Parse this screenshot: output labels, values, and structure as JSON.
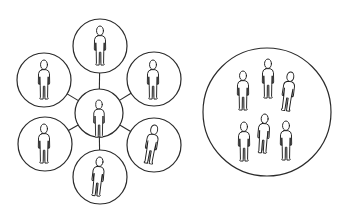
{
  "figure": {
    "title": "Network of individuals vs. group",
    "colors": {
      "stroke": "#2b2b2b",
      "fill": "#ffffff",
      "background": "#ffffff"
    }
  },
  "network": {
    "label": "Hub-and-spoke network",
    "hub": {
      "id": "hub",
      "cx": 99,
      "cy": 113,
      "r": 24,
      "people": [
        {
          "x": 99,
          "y": 100,
          "scale": 1.0,
          "tilt": 0
        }
      ]
    },
    "nodes": [
      {
        "id": "top",
        "cx": 100,
        "cy": 46,
        "r": 27,
        "people": [
          {
            "x": 100,
            "y": 26,
            "scale": 1.05,
            "tilt": 0
          }
        ]
      },
      {
        "id": "upper-right",
        "cx": 154,
        "cy": 79,
        "r": 27,
        "people": [
          {
            "x": 153,
            "y": 60,
            "scale": 1.05,
            "tilt": 0
          }
        ]
      },
      {
        "id": "lower-right",
        "cx": 154,
        "cy": 145,
        "r": 27,
        "people": [
          {
            "x": 155,
            "y": 125,
            "scale": 1.05,
            "tilt": 10
          }
        ]
      },
      {
        "id": "bottom",
        "cx": 100,
        "cy": 177,
        "r": 27,
        "people": [
          {
            "x": 100,
            "y": 157,
            "scale": 1.05,
            "tilt": 6
          }
        ]
      },
      {
        "id": "lower-left",
        "cx": 45,
        "cy": 144,
        "r": 27,
        "people": [
          {
            "x": 44,
            "y": 124,
            "scale": 1.05,
            "tilt": 0
          }
        ]
      },
      {
        "id": "upper-left",
        "cx": 44,
        "cy": 80,
        "r": 27,
        "people": [
          {
            "x": 44,
            "y": 60,
            "scale": 1.05,
            "tilt": 0
          }
        ]
      }
    ]
  },
  "group": {
    "label": "Group enclosed in one circle",
    "cx": 267,
    "cy": 112,
    "r": 64,
    "people": [
      {
        "x": 243,
        "y": 71,
        "scale": 1.05,
        "tilt": 0
      },
      {
        "x": 268,
        "y": 59,
        "scale": 1.05,
        "tilt": 0
      },
      {
        "x": 291,
        "y": 72,
        "scale": 1.05,
        "tilt": 8
      },
      {
        "x": 244,
        "y": 122,
        "scale": 1.05,
        "tilt": 0
      },
      {
        "x": 265,
        "y": 114,
        "scale": 1.05,
        "tilt": 4
      },
      {
        "x": 286,
        "y": 121,
        "scale": 1.05,
        "tilt": 0
      }
    ]
  }
}
